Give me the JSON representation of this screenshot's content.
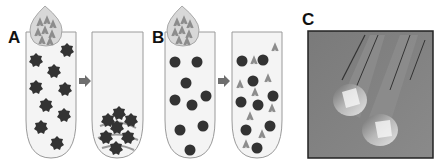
{
  "panels": [
    {
      "id": "A",
      "label": "A",
      "description": "Droplet of antibody-like particles added to tube of star-shaped particles; after mixing particles aggregate at bottom"
    },
    {
      "id": "B",
      "label": "B",
      "description": "Droplet added to tube of round particles; after mixing particles remain dispersed with free antibody-like shapes"
    },
    {
      "id": "C",
      "label": "C",
      "description": "Photograph of two glass tubes"
    }
  ],
  "colors": {
    "particle": "#333333",
    "tube_outline": "#9a9a9a",
    "tube_fill": "#f4f4f4",
    "droplet_fill": "#d8d8d8",
    "arrow": "#6e6e6e",
    "antibody": "#8c8c8c",
    "photo_bg": "#7d7d7d"
  }
}
